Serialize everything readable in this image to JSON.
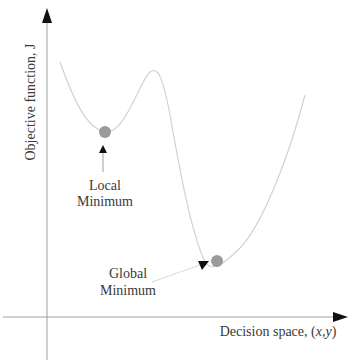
{
  "diagram": {
    "y_axis_label": "Objective function, J",
    "x_axis_label_prefix": "Decision space, (",
    "x_axis_label_var": "x,y",
    "x_axis_label_suffix": ")",
    "local_minimum": {
      "line1": "Local",
      "line2": "Minimum"
    },
    "global_minimum": {
      "line1": "Global",
      "line2": "Minimum"
    },
    "colors": {
      "axis": "#9a9a9a",
      "arrowhead": "#111111",
      "curve": "#d2d2d2",
      "marker": "#9b9b9b",
      "text": "#3a3a3a"
    }
  }
}
